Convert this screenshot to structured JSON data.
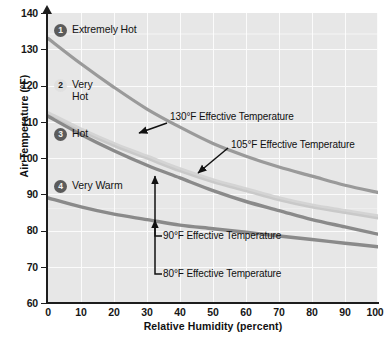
{
  "chart_data": {
    "type": "line",
    "title": "",
    "xlabel": "Relative Humidity (percent)",
    "ylabel": "Air Temperature (°F)",
    "xlim": [
      0,
      100
    ],
    "ylim": [
      60,
      140
    ],
    "xticks": [
      "0",
      "10",
      "20",
      "30",
      "40",
      "50",
      "60",
      "70",
      "80",
      "90",
      "100"
    ],
    "yticks": [
      "140",
      "130",
      "120",
      "110",
      "100",
      "90",
      "80",
      "70",
      "60"
    ],
    "grid": true,
    "legend_position": "inside-left",
    "x": [
      0,
      10,
      20,
      30,
      40,
      50,
      60,
      70,
      80,
      90,
      100
    ],
    "series": [
      {
        "name": "130°F Effective Temperature",
        "color": "#9a9a9a",
        "values": [
          133,
          126,
          119.5,
          113.5,
          108.5,
          104,
          100.5,
          97.5,
          95,
          92.5,
          90.5
        ]
      },
      {
        "name": "105°F Effective Temperature",
        "color": "#c9c9c9",
        "values": [
          112,
          107.5,
          103.5,
          100,
          96.5,
          93.5,
          91,
          88.5,
          86.5,
          85,
          83.5
        ]
      },
      {
        "name": "90°F Effective Temperature",
        "color": "#8a8a8a",
        "values": [
          111.5,
          106.5,
          102,
          98,
          94.5,
          91,
          88,
          85.5,
          83,
          81,
          79
        ]
      },
      {
        "name": "80°F Effective Temperature",
        "color": "#8a8a8a",
        "values": [
          89,
          86.5,
          84.5,
          83,
          81.5,
          80.5,
          79.5,
          78.5,
          77.5,
          76.5,
          75.5
        ]
      }
    ],
    "zones": [
      {
        "number": "1",
        "label": "Extremely Hot",
        "badge_style": "dark"
      },
      {
        "number": "2",
        "label": "Very\nHot",
        "badge_style": "light"
      },
      {
        "number": "3",
        "label": "Hot",
        "badge_style": "dark"
      },
      {
        "number": "4",
        "label": "Very Warm",
        "badge_style": "dark"
      }
    ],
    "annotations": [
      {
        "text": "130°F Effective Temperature",
        "type": "arrow-label"
      },
      {
        "text": "105°F Effective Temperature",
        "type": "arrow-label"
      },
      {
        "text": "90°F Effective Temperature",
        "type": "leader-label"
      },
      {
        "text": "80°F Effective Temperature",
        "type": "leader-label"
      }
    ],
    "colors": {
      "plot_background": "#e7e7e7",
      "gridline": "#fbfbfb",
      "axis": "#1d1d1d",
      "text": "#111111"
    }
  }
}
